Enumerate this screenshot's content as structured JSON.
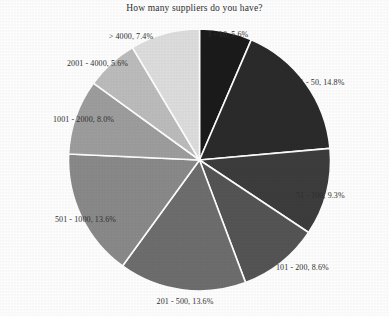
{
  "chart_data": {
    "type": "pie",
    "title": "How many suppliers do you have?",
    "xlabel": "",
    "ylabel": "",
    "legend_position": "none",
    "grid": false,
    "label_format": "category, percent",
    "start_angle_deg": 90,
    "direction": "clockwise",
    "categories": [
      "1 - 10",
      "11 - 50",
      "51 - 100",
      "101 - 200",
      "201 - 500",
      "501 - 1000",
      "1001 - 2000",
      "2001 - 4000",
      "> 4000"
    ],
    "values": [
      5.6,
      14.8,
      9.3,
      8.6,
      13.6,
      13.6,
      8.0,
      5.6,
      7.4
    ],
    "units": "percent",
    "slices": [
      {
        "label": "1 - 10",
        "percent": 5.6,
        "text": "1 - 10, 5.6%",
        "color": "#1b1b1b"
      },
      {
        "label": "11 - 50",
        "percent": 14.8,
        "text": "11 - 50, 14.8%",
        "color": "#2b2b2b"
      },
      {
        "label": "51 - 100",
        "percent": 9.3,
        "text": "51 - 100, 9.3%",
        "color": "#3d3d3d"
      },
      {
        "label": "101 - 200",
        "percent": 8.6,
        "text": "101 - 200, 8.6%",
        "color": "#555555"
      },
      {
        "label": "201 - 500",
        "percent": 13.6,
        "text": "201 - 500, 13.6%",
        "color": "#6e6e6e"
      },
      {
        "label": "501 - 1000",
        "percent": 13.6,
        "text": "501 - 1000, 13.6%",
        "color": "#8a8a8a"
      },
      {
        "label": "1001 - 2000",
        "percent": 8.0,
        "text": "1001 - 2000, 8.0%",
        "color": "#9e9e9e"
      },
      {
        "label": "2001 - 4000",
        "percent": 5.6,
        "text": "2001 - 4000, 5.6%",
        "color": "#bdbdbd"
      },
      {
        "label": "> 4000",
        "percent": 7.4,
        "text": "> 4000, 7.4%",
        "color": "#dedede"
      }
    ],
    "slice_border_color": "#ffffff",
    "background_color": "#ffffff",
    "text_color": "#303030"
  }
}
